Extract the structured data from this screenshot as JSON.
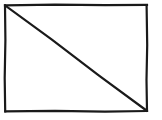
{
  "figure": {
    "title": "Rectangle with diagonal",
    "type": "line-drawing",
    "canvas": {
      "width": 162,
      "height": 120,
      "background_color": "#ffffff"
    },
    "stroke": {
      "color": "#1a1a1a",
      "width": 2.2,
      "style": "solid",
      "appearance": "hand-drawn"
    },
    "shapes": [
      {
        "name": "outer-rectangle",
        "kind": "rectangle",
        "x": 5,
        "y": 5,
        "width": 142,
        "height": 106,
        "points": [
          [
            5,
            5
          ],
          [
            147,
            5
          ],
          [
            147,
            111
          ],
          [
            5,
            111
          ],
          [
            5,
            5
          ]
        ]
      },
      {
        "name": "diagonal-line",
        "kind": "line",
        "from": [
          5,
          5
        ],
        "to": [
          147,
          111
        ],
        "direction": "top-left-to-bottom-right"
      }
    ],
    "regions": [
      {
        "name": "upper-right-triangle",
        "vertices": [
          [
            5,
            5
          ],
          [
            147,
            5
          ],
          [
            147,
            111
          ]
        ],
        "fill": "#ffffff"
      },
      {
        "name": "lower-left-triangle",
        "vertices": [
          [
            5,
            5
          ],
          [
            147,
            111
          ],
          [
            5,
            111
          ]
        ],
        "fill": "#ffffff"
      }
    ],
    "labels": []
  }
}
